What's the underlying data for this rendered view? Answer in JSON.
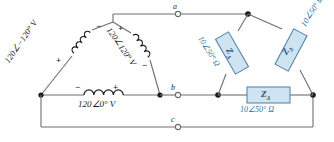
{
  "sources": [
    {
      "id": "source-ab",
      "label": "120∠−120° V",
      "plus": "+",
      "minus": "−",
      "position": "left-diagonal"
    },
    {
      "id": "source-bc",
      "label": "120∠120° V",
      "plus": "+",
      "minus": "−",
      "position": "right-diagonal"
    },
    {
      "id": "source-ca",
      "label": "120∠0° V",
      "plus": "+",
      "minus": "−",
      "position": "bottom-horizontal"
    }
  ],
  "loads": [
    {
      "id": "impedance-ab",
      "box_label": "Z",
      "box_subscript": "Δ",
      "value": "10∠50° Ω",
      "position": "left-diagonal"
    },
    {
      "id": "impedance-bc",
      "box_label": "Z",
      "box_subscript": "Δ",
      "value": "10∠50° Ω",
      "position": "right-diagonal"
    },
    {
      "id": "impedance-ca",
      "box_label": "Z",
      "box_subscript": "Δ",
      "value": "10∠50° Ω",
      "position": "bottom-horizontal"
    }
  ],
  "terminals": [
    {
      "id": "terminal-a",
      "label": "a"
    },
    {
      "id": "terminal-b",
      "label": "b"
    },
    {
      "id": "terminal-c",
      "label": "c"
    }
  ],
  "colors": {
    "wire": "#6e6e6e",
    "node": "#1a1a1a",
    "impedance_fill": "#cfe4f2",
    "impedance_stroke": "#4a7fa5",
    "impedance_text": "#1b4f72",
    "value_text": "#2f6fa8"
  }
}
